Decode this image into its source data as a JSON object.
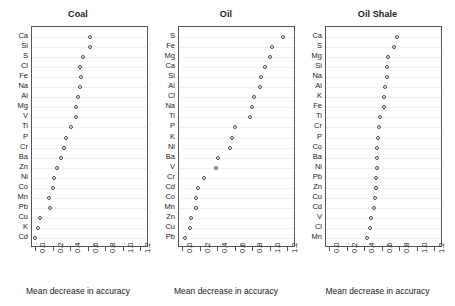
{
  "figure": {
    "width": 455,
    "height": 306,
    "background": "#ffffff",
    "point_color": "#4a4a4a",
    "axis_color": "#555555",
    "grid_color": "#f0f0f0"
  },
  "chart_data": [
    {
      "type": "scatter",
      "title": "Coal",
      "xlabel": "Mean decrease in accuracy",
      "ylabel": "",
      "xlim": [
        -0.04,
        1.28
      ],
      "xticks": [
        0.0,
        0.2,
        0.4,
        0.6,
        0.8,
        1.0,
        1.2
      ],
      "xticklabels": [
        "0.0",
        "0.2",
        "0.4",
        "0.6",
        "0.8",
        "1.0",
        "1.2"
      ],
      "grid": true,
      "legend": "none",
      "categories": [
        "Ca",
        "Si",
        "S",
        "Cl",
        "Fe",
        "Na",
        "Al",
        "Mg",
        "V",
        "Ti",
        "P",
        "Cr",
        "Ba",
        "Zn",
        "Ni",
        "Co",
        "Mn",
        "Pb",
        "Cu",
        "K",
        "Cd"
      ],
      "values": [
        0.63,
        0.62,
        0.54,
        0.51,
        0.52,
        0.51,
        0.49,
        0.47,
        0.46,
        0.41,
        0.35,
        0.33,
        0.29,
        0.25,
        0.21,
        0.2,
        0.16,
        0.17,
        0.05,
        0.03,
        0.0
      ]
    },
    {
      "type": "scatter",
      "title": "Oil",
      "xlabel": "Mean decrease in accuracy",
      "ylabel": "",
      "xlim": [
        -0.04,
        1.28
      ],
      "xticks": [
        0.0,
        0.2,
        0.4,
        0.6,
        0.8,
        1.0,
        1.2
      ],
      "xticklabels": [
        "0.0",
        "0.2",
        "0.4",
        "0.6",
        "0.8",
        "1.0",
        "1.2"
      ],
      "grid": true,
      "legend": "none",
      "categories": [
        "S",
        "Fe",
        "Mg",
        "Ca",
        "Si",
        "Al",
        "Cl",
        "Na",
        "Ti",
        "P",
        "K",
        "Ni",
        "Ba",
        "V",
        "Cr",
        "Cd",
        "Co",
        "Mn",
        "Zn",
        "Cu",
        "Pb"
      ],
      "values": [
        1.15,
        1.03,
        1.01,
        0.95,
        0.9,
        0.89,
        0.82,
        0.8,
        0.77,
        0.6,
        0.57,
        0.55,
        0.41,
        0.38,
        0.25,
        0.18,
        0.15,
        0.16,
        0.1,
        0.09,
        0.03
      ]
    },
    {
      "type": "scatter",
      "title": "Oil Shale",
      "xlabel": "Mean decrease in accuracy",
      "ylabel": "",
      "xlim": [
        -0.04,
        1.28
      ],
      "xticks": [
        0.0,
        0.2,
        0.4,
        0.6,
        0.8,
        1.0,
        1.2
      ],
      "xticklabels": [
        "0.0",
        "0.2",
        "0.4",
        "0.6",
        "0.8",
        "1.0",
        "1.2"
      ],
      "grid": true,
      "legend": "none",
      "categories": [
        "Ca",
        "S",
        "Mg",
        "Si",
        "Na",
        "Al",
        "K",
        "Fe",
        "Ti",
        "Cr",
        "P",
        "Co",
        "Ba",
        "Ni",
        "Pb",
        "Zn",
        "Cu",
        "Cd",
        "V",
        "Cl",
        "Mn"
      ],
      "values": [
        0.78,
        0.74,
        0.67,
        0.66,
        0.66,
        0.64,
        0.63,
        0.63,
        0.58,
        0.57,
        0.56,
        0.55,
        0.54,
        0.54,
        0.53,
        0.53,
        0.52,
        0.51,
        0.48,
        0.47,
        0.43
      ]
    }
  ],
  "panel_layout": [
    {
      "left": 4,
      "width": 148,
      "box_left": 31,
      "box_width": 117
    },
    {
      "left": 152,
      "width": 148,
      "box_left": 178,
      "box_width": 117
    },
    {
      "left": 300,
      "width": 155,
      "box_left": 325,
      "box_width": 117
    }
  ]
}
